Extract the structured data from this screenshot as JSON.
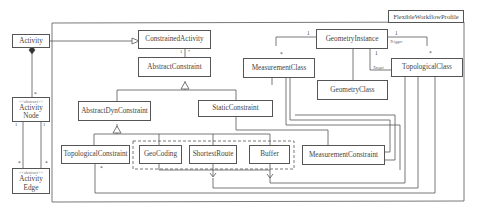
{
  "profile": {
    "name": "FlexibleWorkflowProfile"
  },
  "classes": {
    "activity": {
      "label": "Activity"
    },
    "activity_node": {
      "stereotype": "<<abstract>>",
      "label": "Activity Node"
    },
    "activity_edge": {
      "stereotype": "<<abstract>>",
      "label": "Activity Edge"
    },
    "constrained_activity": {
      "label": "ConstrainedActivity"
    },
    "abstract_constraint": {
      "label": "AbstractConstraint"
    },
    "abstract_dyn_constraint": {
      "label": "AbstractDynConstraint"
    },
    "static_constraint": {
      "label": "StaticConstraint"
    },
    "topological_constraint": {
      "label": "TopologicalConstraint"
    },
    "geocoding": {
      "label": "GeoCoding"
    },
    "shortest_route": {
      "label": "ShortestRoute"
    },
    "buffer": {
      "label": "Buffer"
    },
    "measurement_constraint": {
      "label": "MeasurementConstraint"
    },
    "geometry_instance": {
      "label": "GeometryInstance"
    },
    "measurement_class": {
      "label": "MeasurementClass"
    },
    "geometry_class": {
      "label": "GeometryClass"
    },
    "topological_class": {
      "label": "TopologicalClass"
    }
  },
  "multiplicities": {
    "activity_node_star": "*",
    "node_edge_left_1": "1",
    "node_edge_right_1": "1",
    "edge_left_star": "*",
    "edge_right_star": "*",
    "ca_ac_1": "1",
    "ca_ac_star": "*",
    "gi_mc_1": "1",
    "gi_mc_star": "*",
    "gi_tc_trigger_1": "1",
    "gi_tc_target_1": "1",
    "gi_tc_star": "*",
    "tc_star": "*"
  },
  "roles": {
    "trigger": "Trigger",
    "target": "Target"
  }
}
